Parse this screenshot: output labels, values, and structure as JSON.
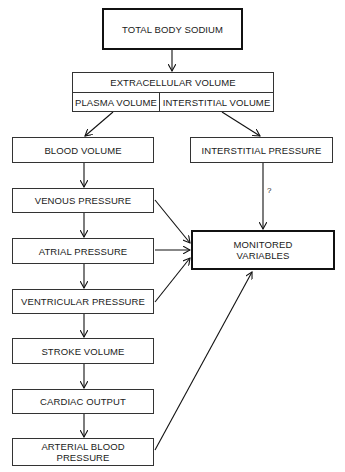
{
  "diagram": {
    "top": {
      "label": "TOTAL BODY SODIUM"
    },
    "ecf": {
      "label": "EXTRACELLULAR VOLUME",
      "plasma": "PLASMA VOLUME",
      "interstitial": "INTERSTITIAL VOLUME"
    },
    "left_chain": [
      {
        "label": "BLOOD VOLUME"
      },
      {
        "label": "VENOUS PRESSURE"
      },
      {
        "label": "ATRIAL PRESSURE"
      },
      {
        "label": "VENTRICULAR PRESSURE"
      },
      {
        "label": "STROKE VOLUME"
      },
      {
        "label": "CARDIAC OUTPUT"
      },
      {
        "label": "ARTERIAL BLOOD PRESSURE"
      }
    ],
    "interstitial_pressure": {
      "label": "INTERSTITIAL PRESSURE"
    },
    "uncertain_link_label": "?",
    "target": {
      "label": "MONITORED VARIABLES"
    }
  }
}
